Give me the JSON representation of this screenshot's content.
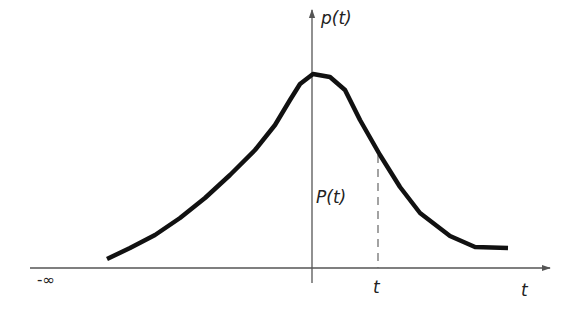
{
  "diagram": {
    "type": "probability-density-curve",
    "labels": {
      "y_axis": "p(t)",
      "area": "P(t)",
      "x_axis": "t",
      "marker_t": "t",
      "neg_infinity": "-∞"
    },
    "colors": {
      "curve": "#111111",
      "axis": "#555555",
      "dashed": "#666666",
      "text": "#222222"
    },
    "curve_points": "107,259 130,248 155,235 180,218 205,198 230,175 255,150 275,125 290,100 300,84 313,74 330,77 345,90 360,120 380,155 400,187 420,213 450,236 475,247 508,248"
  }
}
